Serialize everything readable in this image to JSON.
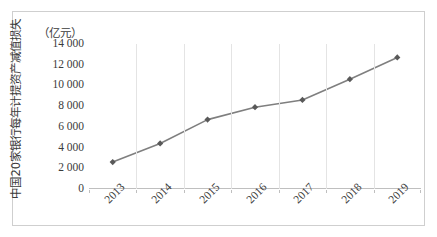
{
  "chart_data": {
    "type": "line",
    "title": "",
    "subtitle": "",
    "xlabel": "",
    "ylabel": "中国20家银行每年计提资产减值损失",
    "unit_caption": "（亿元）",
    "categories": [
      "2013",
      "2014",
      "2015",
      "2016",
      "2017",
      "2018",
      "2019"
    ],
    "series": [
      {
        "name": "中国20家银行每年计提资产减值损失",
        "values": [
          2600,
          4400,
          6700,
          7900,
          8600,
          10600,
          12700
        ]
      }
    ],
    "ylim": [
      0,
      14000
    ],
    "ytick_labels": [
      "14 000",
      "12 000",
      "10 000",
      "8 000",
      "6 000",
      "4 000",
      "2 000",
      "0"
    ],
    "ytick_values": [
      14000,
      12000,
      10000,
      8000,
      6000,
      4000,
      2000,
      0
    ],
    "grid": "vertical",
    "legend": "none",
    "line_color": "#7f7f7f",
    "marker_color": "#595959",
    "marker_shape": "diamond",
    "gridline_color": "#e4e4e4",
    "axis_color": "#bfbfbf",
    "frame_color": "#cfcfcf",
    "background": "#ffffff"
  }
}
